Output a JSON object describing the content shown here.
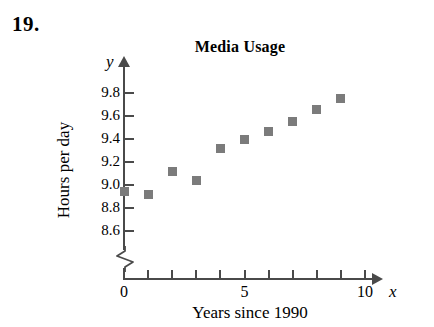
{
  "exercise": {
    "number": "19."
  },
  "top_remnant": {
    "text": ""
  },
  "chart_data": {
    "type": "scatter",
    "title": "Media Usage",
    "xlabel": "Years since 1990",
    "ylabel": "Hours per day",
    "x_axis_variable": "x",
    "y_axis_variable": "y",
    "grid": false,
    "legend": false,
    "xlim": [
      0,
      10
    ],
    "ylim": [
      8.6,
      9.8
    ],
    "y_axis_break": true,
    "marker_color": "#7b7b7b",
    "axis_color": "#4a4a4a",
    "x_ticks": [
      0,
      1,
      2,
      3,
      4,
      5,
      6,
      7,
      8,
      9,
      10
    ],
    "x_tick_labels": [
      {
        "value": 0,
        "label": "0"
      },
      {
        "value": 5,
        "label": "5"
      },
      {
        "value": 10,
        "label": "10"
      }
    ],
    "y_ticks": [
      8.6,
      8.8,
      9.0,
      9.2,
      9.4,
      9.6,
      9.8
    ],
    "y_tick_labels": [
      "8.6",
      "8.8",
      "9.0",
      "9.2",
      "9.4",
      "9.6",
      "9.8"
    ],
    "x": [
      0,
      1,
      2,
      3,
      4,
      5,
      6,
      7,
      8,
      9
    ],
    "values": [
      8.95,
      8.92,
      9.12,
      9.04,
      9.32,
      9.4,
      9.47,
      9.55,
      9.66,
      9.75
    ],
    "points": [
      {
        "x": 0,
        "y": 8.95
      },
      {
        "x": 1,
        "y": 8.92
      },
      {
        "x": 2,
        "y": 9.12
      },
      {
        "x": 3,
        "y": 9.04
      },
      {
        "x": 4,
        "y": 9.32
      },
      {
        "x": 5,
        "y": 9.4
      },
      {
        "x": 6,
        "y": 9.47
      },
      {
        "x": 7,
        "y": 9.55
      },
      {
        "x": 8,
        "y": 9.66
      },
      {
        "x": 9,
        "y": 9.75
      }
    ]
  }
}
